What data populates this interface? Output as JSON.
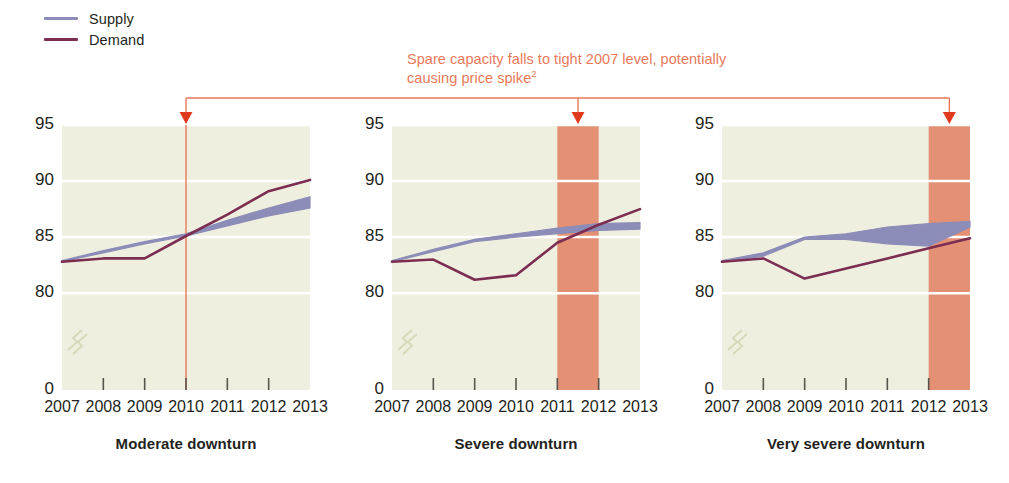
{
  "legend": {
    "items": [
      {
        "label": "Supply",
        "color": "#8c8cb8"
      },
      {
        "label": "Demand",
        "color": "#7b2d52"
      }
    ]
  },
  "annotation": {
    "line1": "Spare capacity falls to tight 2007 level, potentially",
    "line2": "causing price spike",
    "footnote_marker": "2",
    "color": "#e8795a"
  },
  "chart_data": {
    "type": "line",
    "title": "",
    "xlabel": "",
    "ylabel": "",
    "ylim": [
      78.5,
      95
    ],
    "y_ticks": [
      "95",
      "90",
      "85",
      "80",
      "0"
    ],
    "y_tick_values": [
      95,
      90,
      85,
      80,
      0
    ],
    "axis_break": true,
    "grid": true,
    "grid_color": "#ffffff",
    "plot_bg": "#efefe0",
    "categories": [
      2007,
      2008,
      2009,
      2010,
      2011,
      2012,
      2013
    ],
    "x_tick_labels": [
      "2007",
      "2008",
      "2009",
      "2010",
      "2011",
      "2012",
      "2013"
    ],
    "legend_position": "top-left",
    "panels": [
      {
        "title": "Moderate downturn",
        "series": [
          {
            "name": "Supply",
            "type": "band",
            "color": "#8c8cb8",
            "lower": [
              82.8,
              83.6,
              84.4,
              85.1,
              86.0,
              86.9,
              87.6
            ],
            "upper": [
              82.9,
              83.8,
              84.6,
              85.3,
              86.5,
              87.6,
              88.6
            ]
          },
          {
            "name": "Demand",
            "type": "line",
            "color": "#7b2d52",
            "values": [
              82.8,
              83.1,
              83.1,
              85.1,
              87.0,
              89.1,
              90.1
            ]
          }
        ],
        "highlight_band": null,
        "marker_line": {
          "year": 2010,
          "color": "#e8795a"
        }
      },
      {
        "title": "Severe downturn",
        "series": [
          {
            "name": "Supply",
            "type": "band",
            "color": "#8c8cb8",
            "lower": [
              82.8,
              83.7,
              84.6,
              85.0,
              85.3,
              85.6,
              85.7
            ],
            "upper": [
              82.9,
              83.9,
              84.8,
              85.3,
              85.8,
              86.2,
              86.3
            ]
          },
          {
            "name": "Demand",
            "type": "line",
            "color": "#7b2d52",
            "values": [
              82.8,
              83.0,
              81.2,
              81.6,
              84.5,
              86.1,
              87.5
            ]
          }
        ],
        "highlight_band": {
          "from": 2011,
          "to": 2012,
          "color": "#e39074"
        },
        "marker_line": null
      },
      {
        "title": "Very severe downturn",
        "series": [
          {
            "name": "Supply",
            "type": "band",
            "color": "#8c8cb8",
            "lower": [
              82.8,
              83.3,
              84.8,
              84.8,
              84.4,
              84.2,
              85.9
            ],
            "upper": [
              82.9,
              83.6,
              85.0,
              85.3,
              85.9,
              86.2,
              86.4
            ]
          },
          {
            "name": "Demand",
            "type": "line",
            "color": "#7b2d52",
            "values": [
              82.8,
              83.1,
              81.3,
              82.2,
              83.1,
              84.0,
              84.9
            ]
          }
        ],
        "highlight_band": {
          "from": 2012,
          "to": 2013,
          "color": "#e39074"
        },
        "marker_line": null
      }
    ],
    "connector": {
      "color": "#e8795a",
      "arrow_color": "#e03a1e",
      "targets": [
        {
          "panel": 0,
          "year": 2010
        },
        {
          "panel": 1,
          "year": 2011.5
        },
        {
          "panel": 2,
          "year": 2012.5
        }
      ]
    }
  }
}
